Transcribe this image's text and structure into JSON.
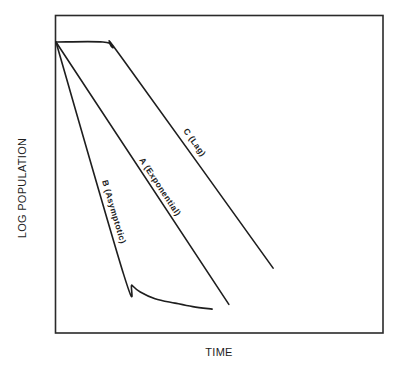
{
  "chart_data": {
    "type": "line",
    "title": "",
    "xlabel": "TIME",
    "ylabel": "LOG POPULATION",
    "xlim": [
      0,
      100
    ],
    "ylim": [
      0,
      100
    ],
    "grid": false,
    "ticks": false,
    "legend": "none (inline labels)",
    "series": [
      {
        "id": "A",
        "name": "A (Exponential)",
        "x": [
          0.3,
          53.0
        ],
        "y": [
          91.5,
          9.0
        ]
      },
      {
        "id": "B",
        "name": "B (Asymptotic)",
        "x": [
          0.3,
          21.0,
          23.5,
          26.0,
          30.5,
          36.6,
          42.0,
          47.9
        ],
        "y": [
          91.5,
          18.2,
          15.0,
          12.9,
          10.8,
          9.4,
          8.3,
          7.5
        ]
      },
      {
        "id": "C",
        "name": "C (Lag)",
        "x": [
          0.3,
          14.6,
          17.5,
          21.3,
          66.5
        ],
        "y": [
          91.5,
          91.5,
          89.8,
          85.2,
          20.4
        ]
      }
    ]
  }
}
